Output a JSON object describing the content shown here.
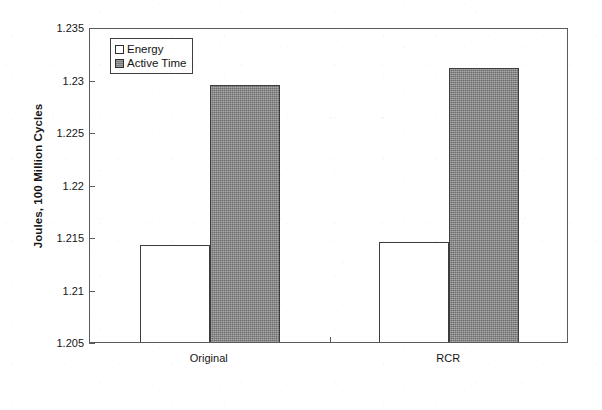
{
  "chart_data": {
    "type": "bar",
    "title": "",
    "subtitle": "",
    "xlabel": "",
    "ylabel": "Joules, 100 Million Cycles",
    "categories": [
      "Original",
      "RCR"
    ],
    "series": [
      {
        "name": "Energy",
        "values": [
          1.2142,
          1.2145
        ],
        "color": "#ffffff"
      },
      {
        "name": "Active Time",
        "values": [
          1.2295,
          1.2311
        ],
        "color": "#878787"
      }
    ],
    "ylim": [
      1.205,
      1.235
    ],
    "ytick_labels": [
      "1.235",
      "1.23",
      "1.225",
      "1.22",
      "1.215",
      "1.21",
      "1.205"
    ],
    "ytick_values": [
      1.235,
      1.23,
      1.225,
      1.22,
      1.215,
      1.21,
      1.205
    ],
    "ytick_step": 0.005,
    "grid": false,
    "legend_position": "top-left-inside",
    "legend_entries": [
      {
        "label": "Energy",
        "swatch": "hollow-square"
      },
      {
        "label": "Active Time",
        "swatch": "gray-filled-square"
      }
    ],
    "axis_color": "#5a5a5a",
    "bar_outline_color": "#3c3c3c",
    "background": "#ffffff"
  }
}
